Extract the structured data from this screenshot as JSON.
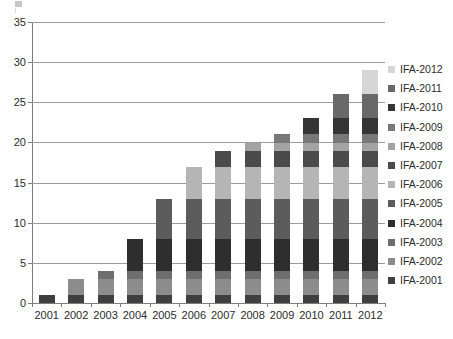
{
  "chart_data": {
    "type": "bar",
    "variant": "stacked-vertical",
    "title": "",
    "subtitle": "",
    "xlabel": "",
    "ylabel": "",
    "categories": [
      "2001",
      "2002",
      "2003",
      "2004",
      "2005",
      "2006",
      "2007",
      "2008",
      "2009",
      "2010",
      "2011",
      "2012"
    ],
    "ylim": [
      0,
      35
    ],
    "ytick_labels": [
      "0",
      "5",
      "10",
      "15",
      "20",
      "25",
      "30",
      "35"
    ],
    "ytick_values": [
      0,
      5,
      10,
      15,
      20,
      25,
      30,
      35
    ],
    "ytick_interval": 5,
    "grid": true,
    "grid_axis": "y",
    "legend_position": "right",
    "legend_order": "reverse",
    "totals": [
      1,
      3,
      4,
      8,
      13,
      17,
      19,
      20,
      21,
      23,
      26,
      29
    ],
    "series": [
      {
        "name": "IFA-2001",
        "color": "#3f3f3f",
        "values": [
          1,
          1,
          1,
          1,
          1,
          1,
          1,
          1,
          1,
          1,
          1,
          1
        ]
      },
      {
        "name": "IFA-2002",
        "color": "#8c8c8c",
        "values": [
          0,
          2,
          2,
          2,
          2,
          2,
          2,
          2,
          2,
          2,
          2,
          2
        ]
      },
      {
        "name": "IFA-2003",
        "color": "#6e6e6e",
        "values": [
          0,
          0,
          1,
          1,
          1,
          1,
          1,
          1,
          1,
          1,
          1,
          1
        ]
      },
      {
        "name": "IFA-2004",
        "color": "#2e2e2e",
        "values": [
          0,
          0,
          0,
          4,
          4,
          4,
          4,
          4,
          4,
          4,
          4,
          4
        ]
      },
      {
        "name": "IFA-2005",
        "color": "#5c5c5c",
        "values": [
          0,
          0,
          0,
          0,
          5,
          5,
          5,
          5,
          5,
          5,
          5,
          5
        ]
      },
      {
        "name": "IFA-2006",
        "color": "#b5b5b5",
        "values": [
          0,
          0,
          0,
          0,
          0,
          4,
          4,
          4,
          4,
          4,
          4,
          4
        ]
      },
      {
        "name": "IFA-2007",
        "color": "#4a4a4a",
        "values": [
          0,
          0,
          0,
          0,
          0,
          0,
          2,
          2,
          2,
          2,
          2,
          2
        ]
      },
      {
        "name": "IFA-2008",
        "color": "#a3a3a3",
        "values": [
          0,
          0,
          0,
          0,
          0,
          0,
          0,
          1,
          1,
          1,
          1,
          1
        ]
      },
      {
        "name": "IFA-2009",
        "color": "#787878",
        "values": [
          0,
          0,
          0,
          0,
          0,
          0,
          0,
          0,
          1,
          1,
          1,
          1
        ]
      },
      {
        "name": "IFA-2010",
        "color": "#353535",
        "values": [
          0,
          0,
          0,
          0,
          0,
          0,
          0,
          0,
          0,
          2,
          2,
          2
        ]
      },
      {
        "name": "IFA-2011",
        "color": "#696969",
        "values": [
          0,
          0,
          0,
          0,
          0,
          0,
          0,
          0,
          0,
          0,
          3,
          3
        ]
      },
      {
        "name": "IFA-2012",
        "color": "#d6d6d6",
        "values": [
          0,
          0,
          0,
          0,
          0,
          0,
          0,
          0,
          0,
          0,
          0,
          3
        ]
      }
    ]
  },
  "legend": {
    "items": [
      {
        "label": "IFA-2012",
        "color": "#d6d6d6"
      },
      {
        "label": "IFA-2011",
        "color": "#696969"
      },
      {
        "label": "IFA-2010",
        "color": "#353535"
      },
      {
        "label": "IFA-2009",
        "color": "#787878"
      },
      {
        "label": "IFA-2008",
        "color": "#a3a3a3"
      },
      {
        "label": "IFA-2007",
        "color": "#4a4a4a"
      },
      {
        "label": "IFA-2006",
        "color": "#b5b5b5"
      },
      {
        "label": "IFA-2005",
        "color": "#5c5c5c"
      },
      {
        "label": "IFA-2004",
        "color": "#2e2e2e"
      },
      {
        "label": "IFA-2003",
        "color": "#6e6e6e"
      },
      {
        "label": "IFA-2002",
        "color": "#8c8c8c"
      },
      {
        "label": "IFA-2001",
        "color": "#3f3f3f"
      }
    ]
  },
  "style": {
    "axis_color": "#7d7d7d",
    "grid_color": "#9b9b9b",
    "text_color": "#2b2b2b",
    "background": "#ffffff"
  }
}
